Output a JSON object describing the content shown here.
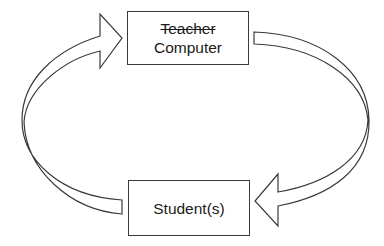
{
  "diagram": {
    "top_box": {
      "struck_label": "Teacher",
      "label": "Computer"
    },
    "bottom_box": {
      "label": "Student(s)"
    },
    "arrows": [
      {
        "from": "Student(s)",
        "to": "Computer",
        "side": "left",
        "direction": "clockwise"
      },
      {
        "from": "Computer",
        "to": "Student(s)",
        "side": "right",
        "direction": "clockwise"
      }
    ],
    "colors": {
      "stroke": "#3a3a3a",
      "fill": "#ffffff",
      "text": "#1a1a1a"
    }
  }
}
